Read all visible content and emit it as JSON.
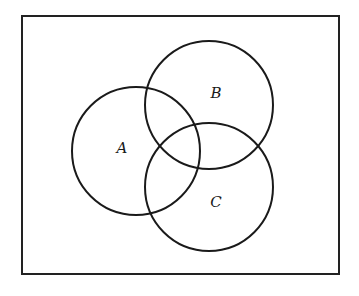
{
  "diagram": {
    "type": "venn",
    "universe": {
      "x": 22,
      "y": 16,
      "width": 317,
      "height": 258,
      "stroke": "#222222"
    },
    "sets": [
      {
        "label": "A",
        "cx": 136,
        "cy": 151,
        "r": 64,
        "label_x": 122,
        "label_y": 153
      },
      {
        "label": "B",
        "cx": 209,
        "cy": 105,
        "r": 64,
        "label_x": 216,
        "label_y": 98
      },
      {
        "label": "C",
        "cx": 209,
        "cy": 187,
        "r": 64,
        "label_x": 216,
        "label_y": 207
      }
    ]
  }
}
